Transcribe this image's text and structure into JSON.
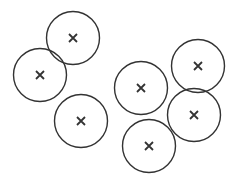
{
  "diagram": {
    "stroke_color": "#333333",
    "background": "#ffffff",
    "circles": [
      {
        "cx": 73,
        "cy": 38,
        "r": 26.5,
        "marker": "cross-icon"
      },
      {
        "cx": 40,
        "cy": 75,
        "r": 26.5,
        "marker": "cross-icon"
      },
      {
        "cx": 81,
        "cy": 121,
        "r": 26.5,
        "marker": "cross-icon"
      },
      {
        "cx": 141,
        "cy": 88,
        "r": 26.5,
        "marker": "cross-icon"
      },
      {
        "cx": 198,
        "cy": 66,
        "r": 26.5,
        "marker": "cross-icon"
      },
      {
        "cx": 194,
        "cy": 115,
        "r": 26.5,
        "marker": "cross-icon"
      },
      {
        "cx": 149,
        "cy": 146,
        "r": 26.5,
        "marker": "cross-icon"
      }
    ]
  }
}
